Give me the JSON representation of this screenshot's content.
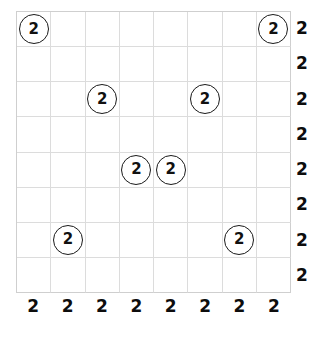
{
  "puzzle": {
    "type": "number-placement-grid",
    "grid": {
      "columns": 8,
      "rows": 8,
      "line_color": "#dcdcdc",
      "border_color": "#cfcfcf",
      "background_color": "#ffffff"
    },
    "token": {
      "shape": "circle",
      "stroke_color": "#1a1a1a",
      "text_color": "#111111"
    },
    "cells": [
      [
        {
          "value": "2",
          "circled": true
        },
        {
          "value": "",
          "circled": false
        },
        {
          "value": "",
          "circled": false
        },
        {
          "value": "",
          "circled": false
        },
        {
          "value": "",
          "circled": false
        },
        {
          "value": "",
          "circled": false
        },
        {
          "value": "",
          "circled": false
        },
        {
          "value": "2",
          "circled": true
        }
      ],
      [
        {
          "value": "",
          "circled": false
        },
        {
          "value": "",
          "circled": false
        },
        {
          "value": "",
          "circled": false
        },
        {
          "value": "",
          "circled": false
        },
        {
          "value": "",
          "circled": false
        },
        {
          "value": "",
          "circled": false
        },
        {
          "value": "",
          "circled": false
        },
        {
          "value": "",
          "circled": false
        }
      ],
      [
        {
          "value": "",
          "circled": false
        },
        {
          "value": "",
          "circled": false
        },
        {
          "value": "2",
          "circled": true
        },
        {
          "value": "",
          "circled": false
        },
        {
          "value": "",
          "circled": false
        },
        {
          "value": "2",
          "circled": true
        },
        {
          "value": "",
          "circled": false
        },
        {
          "value": "",
          "circled": false
        }
      ],
      [
        {
          "value": "",
          "circled": false
        },
        {
          "value": "",
          "circled": false
        },
        {
          "value": "",
          "circled": false
        },
        {
          "value": "",
          "circled": false
        },
        {
          "value": "",
          "circled": false
        },
        {
          "value": "",
          "circled": false
        },
        {
          "value": "",
          "circled": false
        },
        {
          "value": "",
          "circled": false
        }
      ],
      [
        {
          "value": "",
          "circled": false
        },
        {
          "value": "",
          "circled": false
        },
        {
          "value": "",
          "circled": false
        },
        {
          "value": "2",
          "circled": true
        },
        {
          "value": "2",
          "circled": true
        },
        {
          "value": "",
          "circled": false
        },
        {
          "value": "",
          "circled": false
        },
        {
          "value": "",
          "circled": false
        }
      ],
      [
        {
          "value": "",
          "circled": false
        },
        {
          "value": "",
          "circled": false
        },
        {
          "value": "",
          "circled": false
        },
        {
          "value": "",
          "circled": false
        },
        {
          "value": "",
          "circled": false
        },
        {
          "value": "",
          "circled": false
        },
        {
          "value": "",
          "circled": false
        },
        {
          "value": "",
          "circled": false
        }
      ],
      [
        {
          "value": "",
          "circled": false
        },
        {
          "value": "2",
          "circled": true
        },
        {
          "value": "",
          "circled": false
        },
        {
          "value": "",
          "circled": false
        },
        {
          "value": "",
          "circled": false
        },
        {
          "value": "",
          "circled": false
        },
        {
          "value": "2",
          "circled": true
        },
        {
          "value": "",
          "circled": false
        }
      ],
      [
        {
          "value": "",
          "circled": false
        },
        {
          "value": "",
          "circled": false
        },
        {
          "value": "",
          "circled": false
        },
        {
          "value": "",
          "circled": false
        },
        {
          "value": "",
          "circled": false
        },
        {
          "value": "",
          "circled": false
        },
        {
          "value": "",
          "circled": false
        },
        {
          "value": "",
          "circled": false
        }
      ]
    ],
    "row_clues": [
      "2",
      "2",
      "2",
      "2",
      "2",
      "2",
      "2",
      "2"
    ],
    "column_clues": [
      "2",
      "2",
      "2",
      "2",
      "2",
      "2",
      "2",
      "2"
    ]
  }
}
